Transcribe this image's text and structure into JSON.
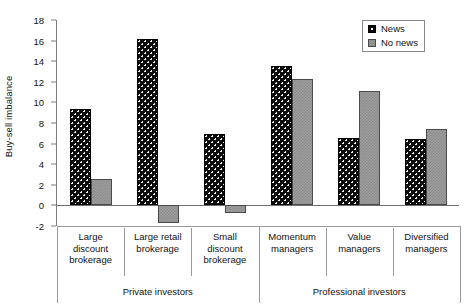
{
  "chart_data": {
    "type": "bar",
    "title": "",
    "subtitle": "",
    "xlabel": "",
    "ylabel": "Buy-sell imbalance",
    "ylim": [
      -2,
      18
    ],
    "yticks": [
      18,
      16,
      14,
      12,
      10,
      8,
      6,
      4,
      2,
      0,
      -2
    ],
    "grid": false,
    "legend_position": "top-right",
    "categories": [
      "Large discount brokerage",
      "Large retail brokerage",
      "Small discount brokerage",
      "Momentum managers",
      "Value managers",
      "Diversified managers"
    ],
    "category_lines": [
      [
        "Large",
        "discount",
        "brokerage"
      ],
      [
        "Large retail",
        "brokerage"
      ],
      [
        "Small",
        "discount",
        "brokerage"
      ],
      [
        "Momentum",
        "managers"
      ],
      [
        "Value",
        "managers"
      ],
      [
        "Diversified",
        "managers"
      ]
    ],
    "groups": [
      {
        "label": "Private investors",
        "span": 3
      },
      {
        "label": "Professional investors",
        "span": 3
      }
    ],
    "series": [
      {
        "name": "News",
        "color": "#0c0c0c",
        "values": [
          9.4,
          16.2,
          6.9,
          13.5,
          6.5,
          6.4
        ]
      },
      {
        "name": "No news",
        "color": "#9d9d9d",
        "values": [
          2.6,
          -1.7,
          -0.7,
          12.3,
          11.1,
          7.4
        ]
      }
    ]
  },
  "legend": {
    "items": [
      {
        "label": "News",
        "swatch": "news-swatch"
      },
      {
        "label": "No news",
        "swatch": "no-news-swatch"
      }
    ]
  },
  "axes": {
    "y_label": "Buy-sell imbalance",
    "y_ticks": [
      "18",
      "16",
      "14",
      "12",
      "10",
      "8",
      "6",
      "4",
      "2",
      "0",
      "-2"
    ]
  },
  "colors": {
    "news": "#0c0c0c",
    "no_news": "#9d9d9d",
    "axis": "#7d7d7d",
    "rule": "#9a9a9a",
    "text": "#111111"
  }
}
